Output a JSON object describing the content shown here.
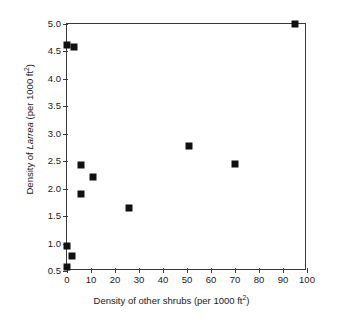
{
  "chart_data": {
    "type": "scatter",
    "title": "",
    "xlabel": "Density of other shrubs (per 1000 ft2)",
    "ylabel": "Density of Larrea (per 1000 ft2)",
    "xlabel_parts": {
      "pre": "Density of other shrubs (per 1000 ft",
      "sup": "2",
      "post": ")"
    },
    "ylabel_parts": {
      "pre": "Density of ",
      "italic": "Larrea",
      "mid": " (per 1000 ft",
      "sup": "2",
      "post": ")"
    },
    "xlim": [
      0,
      100
    ],
    "ylim": [
      0.5,
      5.0
    ],
    "xticks": [
      0,
      10,
      20,
      30,
      40,
      50,
      60,
      70,
      80,
      90,
      100
    ],
    "xticklabels": [
      "0",
      "10",
      "20",
      "30",
      "40",
      "50",
      "60",
      "70",
      "80",
      "90",
      "100"
    ],
    "yticks": [
      0.5,
      1.0,
      1.5,
      2.0,
      2.5,
      3.0,
      3.5,
      4.0,
      4.5,
      5.0
    ],
    "yticklabels": [
      "0.5",
      "1.0",
      "1.5",
      "2.0",
      "2.5",
      "3.0",
      "3.5",
      "4.0",
      "4.5",
      "5.0"
    ],
    "grid": false,
    "legend": null,
    "marker": "filled-square",
    "marker_color": "#111111",
    "axis_color": "#3a3a3a",
    "background": "#ffffff",
    "series": [
      {
        "name": "observations",
        "points": [
          {
            "x": 0,
            "y": 4.62
          },
          {
            "x": 3,
            "y": 4.58
          },
          {
            "x": 6,
            "y": 2.43
          },
          {
            "x": 11,
            "y": 2.21
          },
          {
            "x": 6,
            "y": 1.9
          },
          {
            "x": 26,
            "y": 1.64
          },
          {
            "x": 51,
            "y": 2.78
          },
          {
            "x": 70,
            "y": 2.45
          },
          {
            "x": 95,
            "y": 5.0
          },
          {
            "x": 0,
            "y": 0.96
          },
          {
            "x": 2,
            "y": 0.77
          },
          {
            "x": 0,
            "y": 0.58
          }
        ]
      }
    ]
  }
}
